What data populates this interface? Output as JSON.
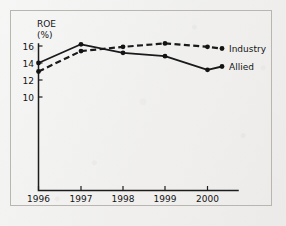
{
  "chart_data": {
    "type": "line",
    "title": "",
    "xlabel": "",
    "ylabel": "ROE (%)",
    "ylabel_line1": "ROE",
    "ylabel_line2": "(%)",
    "categories": [
      "1996",
      "1997",
      "1998",
      "1999",
      "2000"
    ],
    "x": [
      1996,
      1997,
      1998,
      1999,
      2000
    ],
    "xlim": [
      1995.7,
      2000.6
    ],
    "ylim": [
      9.0,
      17.0
    ],
    "yticks": [
      10,
      12,
      14,
      16
    ],
    "ytick_labels": [
      "10",
      "12",
      "14",
      "16"
    ],
    "xtick_labels": [
      "1996",
      "1997",
      "1998",
      "1999",
      "2000"
    ],
    "grid": false,
    "legend_position": "right-inline",
    "series": [
      {
        "name": "Industry",
        "style": "dashed",
        "color": "#1a1a1a",
        "values": [
          13.0,
          15.4,
          15.9,
          16.3,
          15.9
        ]
      },
      {
        "name": "Allied",
        "style": "solid",
        "color": "#1a1a1a",
        "values": [
          14.0,
          16.2,
          15.2,
          14.8,
          13.2
        ]
      }
    ]
  },
  "legend": {
    "industry_label": "Industry",
    "allied_label": "Allied"
  },
  "axes": {
    "y_title_top": "ROE",
    "y_title_bottom": "(%)"
  },
  "colors": {
    "ink": "#1a1a1a",
    "paper": "#f0efee",
    "frame": "#b9b6b2"
  }
}
